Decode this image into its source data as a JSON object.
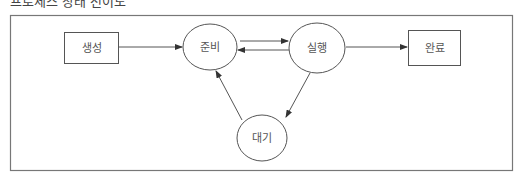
{
  "caption": "프로세스 상태 전이도",
  "colors": {
    "stroke": "#555555",
    "frame": "#777777",
    "text": "#555555",
    "background": "#ffffff"
  },
  "diagram": {
    "type": "state-transition",
    "nodes": [
      {
        "id": "create",
        "label": "생성",
        "shape": "rectangle"
      },
      {
        "id": "ready",
        "label": "준비",
        "shape": "ellipse"
      },
      {
        "id": "running",
        "label": "실행",
        "shape": "ellipse"
      },
      {
        "id": "done",
        "label": "완료",
        "shape": "rectangle"
      },
      {
        "id": "waiting",
        "label": "대기",
        "shape": "ellipse"
      }
    ],
    "edges": [
      {
        "from": "create",
        "to": "ready"
      },
      {
        "from": "ready",
        "to": "running"
      },
      {
        "from": "running",
        "to": "ready"
      },
      {
        "from": "running",
        "to": "done"
      },
      {
        "from": "running",
        "to": "waiting"
      },
      {
        "from": "waiting",
        "to": "ready"
      }
    ]
  }
}
